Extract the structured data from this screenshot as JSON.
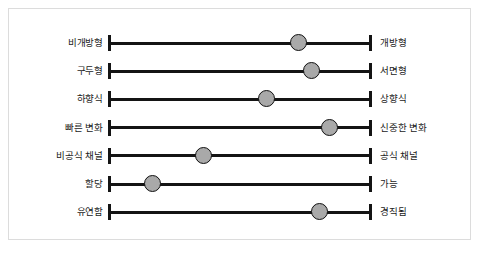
{
  "figure": {
    "title": "",
    "frame_color": "#dcdcdc",
    "background": "#ffffff"
  },
  "chart_data": {
    "type": "scatter",
    "subtype": "semantic-differential-bipolar-scale",
    "title": "",
    "xlabel": "",
    "ylabel": "",
    "xlim": [
      0,
      100
    ],
    "grid": false,
    "legend": "none",
    "marker_color": "#a9a9a9",
    "marker_edge_color": "#111111",
    "axis_color": "#141414",
    "categories": [
      "비개방형 – 개방형",
      "구두형 – 서면형",
      "하향식 – 상향식",
      "빠른 변화 – 신중한 변화",
      "비공식 채널 – 공식 채널",
      "할당 – 가능",
      "유연함 – 경직됨"
    ],
    "left_labels": [
      "비개방형",
      "구두형",
      "하향식",
      "빠른 변화",
      "비공식 채널",
      "할당",
      "유연함"
    ],
    "right_labels": [
      "개방형",
      "서면형",
      "상향식",
      "신중한 변화",
      "공식 채널",
      "가능",
      "경직됨"
    ],
    "values": [
      72,
      77,
      60,
      84,
      36,
      17,
      80
    ]
  },
  "rows": [
    {
      "left": "비개방형",
      "right": "개방형",
      "value": 72
    },
    {
      "left": "구두형",
      "right": "서면형",
      "value": 77
    },
    {
      "left": "하향식",
      "right": "상향식",
      "value": 60
    },
    {
      "left": "빠른 변화",
      "right": "신중한 변화",
      "value": 84
    },
    {
      "left": "비공식 채널",
      "right": "공식 채널",
      "value": 36
    },
    {
      "left": "할당",
      "right": "가능",
      "value": 17
    },
    {
      "left": "유연함",
      "right": "경직됨",
      "value": 80
    }
  ]
}
